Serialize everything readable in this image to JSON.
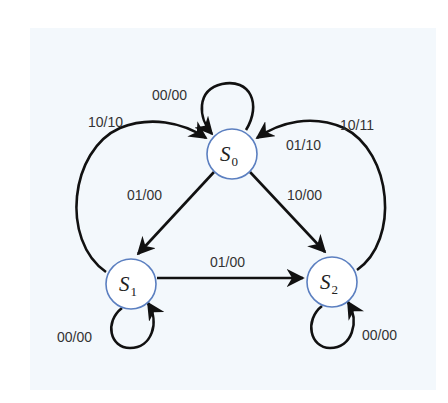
{
  "diagram": {
    "type": "state-machine",
    "colors": {
      "panel_bg": "#f3f8fc",
      "node_border": "#5b7fc0",
      "edge": "#111111",
      "label": "#333333"
    },
    "states": [
      {
        "id": "S0",
        "name": "S",
        "subscript": "0",
        "cx": 232,
        "cy": 154
      },
      {
        "id": "S1",
        "name": "S",
        "subscript": "1",
        "cx": 131,
        "cy": 284
      },
      {
        "id": "S2",
        "name": "S",
        "subscript": "2",
        "cx": 332,
        "cy": 282
      }
    ],
    "transitions": [
      {
        "from": "S0",
        "to": "S0",
        "label": "00/00"
      },
      {
        "from": "S1",
        "to": "S0",
        "label": "10/10"
      },
      {
        "from": "S2",
        "to": "S0",
        "label": "10/11"
      },
      {
        "from": "S2",
        "to": "S0",
        "label": "01/10"
      },
      {
        "from": "S0",
        "to": "S1",
        "label": "01/00"
      },
      {
        "from": "S0",
        "to": "S2",
        "label": "10/00"
      },
      {
        "from": "S1",
        "to": "S2",
        "label": "01/00"
      },
      {
        "from": "S1",
        "to": "S1",
        "label": "00/00"
      },
      {
        "from": "S2",
        "to": "S2",
        "label": "00/00"
      }
    ]
  }
}
